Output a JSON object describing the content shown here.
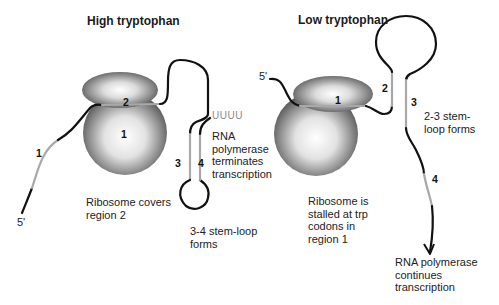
{
  "panels": {
    "high": {
      "title": "High tryptophan",
      "five_prime": "5'",
      "region_labels": {
        "r1_strand": "1",
        "r1_ribosome": "1",
        "r2": "2",
        "r3": "3",
        "r4": "4"
      },
      "poly_u": "UUUU",
      "annotations": {
        "ribosome": "Ribosome covers region 2",
        "ribosome_lines": [
          "Ribosome covers",
          "region 2"
        ],
        "terminator_lines": [
          "RNA",
          "polymerase",
          "terminates",
          "transcription"
        ],
        "stemloop_lines": [
          "3-4 stem-loop",
          "forms"
        ]
      }
    },
    "low": {
      "title": "Low tryptophan",
      "five_prime": "5'",
      "region_labels": {
        "r1": "1",
        "r2": "2",
        "r3": "3",
        "r4": "4"
      },
      "annotations": {
        "stemloop_lines": [
          "2-3 stem-",
          "loop forms"
        ],
        "ribosome_lines": [
          "Ribosome is",
          "stalled at trp",
          "codons in",
          "region 1"
        ],
        "continue_lines": [
          "RNA polymerase",
          "continues",
          "transcription"
        ]
      }
    }
  },
  "colors": {
    "strand": "#111111",
    "region_highlight": "#a8a8a8",
    "ribosome_dark": "#5a5a5a",
    "ribosome_light": "#ffffff"
  }
}
